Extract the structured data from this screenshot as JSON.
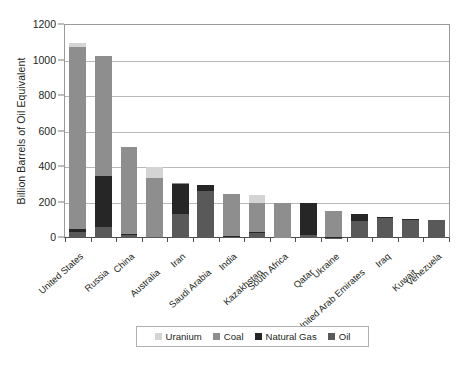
{
  "chart_data": {
    "type": "bar",
    "title": "",
    "xlabel": "",
    "ylabel": "Billion Barrels of Oil Equivalent",
    "ylim": [
      0,
      1200
    ],
    "ytick_values": [
      0,
      200,
      400,
      600,
      800,
      1000,
      1200
    ],
    "ytick_labels": [
      "0",
      "200",
      "400",
      "600",
      "800",
      "1000",
      "1200"
    ],
    "grid": "horizontal",
    "stacked": true,
    "stack_order_bottom_to_top": [
      "Oil",
      "Natural Gas",
      "Coal",
      "Uranium"
    ],
    "legend_position": "bottom",
    "categories": [
      "United States",
      "Russia",
      "China",
      "Australia",
      "Iran",
      "Saudi Arabia",
      "India",
      "Kazakhstan",
      "South Africa",
      "Qatar",
      "Ukraine",
      "United Arab Emirates",
      "Iraq",
      "Kuwait",
      "Venezuela"
    ],
    "series": [
      {
        "name": "Oil",
        "color": "#595959",
        "values": [
          35,
          60,
          16,
          4,
          135,
          265,
          6,
          30,
          0,
          15,
          2,
          98,
          115,
          102,
          99
        ]
      },
      {
        "name": "Natural Gas",
        "color": "#262626",
        "values": [
          15,
          290,
          7,
          4,
          170,
          35,
          6,
          5,
          0,
          185,
          4,
          35,
          6,
          8,
          5
        ]
      },
      {
        "name": "Coal",
        "color": "#8e8e8e",
        "values": [
          1025,
          675,
          492,
          330,
          5,
          0,
          235,
          165,
          198,
          0,
          145,
          0,
          0,
          0,
          0
        ]
      },
      {
        "name": "Uranium",
        "color": "#d4d4d4",
        "values": [
          25,
          0,
          0,
          65,
          0,
          0,
          3,
          40,
          0,
          0,
          0,
          0,
          0,
          0,
          0
        ]
      }
    ],
    "totals": [
      1100,
      1025,
      515,
      403,
      310,
      300,
      250,
      240,
      198,
      200,
      151,
      133,
      121,
      110,
      104
    ],
    "legend_entries": [
      {
        "label": "Uranium",
        "color": "#d4d4d4"
      },
      {
        "label": "Coal",
        "color": "#8e8e8e"
      },
      {
        "label": "Natural Gas",
        "color": "#262626"
      },
      {
        "label": "Oil",
        "color": "#595959"
      }
    ]
  }
}
